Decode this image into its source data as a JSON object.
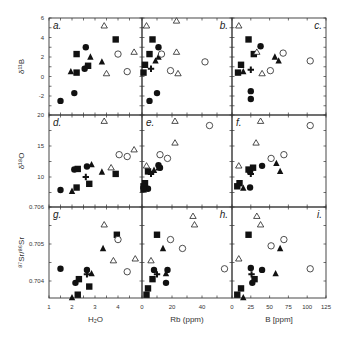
{
  "figure": {
    "panels": [
      "a.",
      "b.",
      "c.",
      "d.",
      "e.",
      "f.",
      "g.",
      "h.",
      "i."
    ],
    "x_axes": [
      {
        "label": "H₂O",
        "ticks": [
          "1",
          "2",
          "3",
          "4"
        ]
      },
      {
        "label": "Rb (ppm)",
        "ticks": [
          "0",
          "20",
          "40"
        ]
      },
      {
        "label": "B [ppm]",
        "ticks": [
          "0",
          "25",
          "50",
          "75",
          "100",
          "125"
        ]
      }
    ],
    "y_axes": [
      {
        "label": "δ¹¹B",
        "ticks": [
          "6",
          "4",
          "2",
          "0",
          "-2"
        ]
      },
      {
        "label": "δ¹⁸O",
        "ticks": [
          "20",
          "15",
          "10"
        ]
      },
      {
        "label": "⁸⁷Sr/⁸⁶Sr",
        "ticks": [
          "0.706",
          "0.705",
          "0.704"
        ]
      }
    ]
  },
  "chart_data": {
    "type": "scatter",
    "title": "",
    "layout": "3x3 scatter matrix with shared axes",
    "marker_legend": [
      "filled circle",
      "filled square",
      "filled triangle",
      "cross",
      "open circle",
      "open triangle"
    ],
    "x_variables": [
      {
        "name": "H2O",
        "xlabel": "H₂O",
        "xlim": [
          1,
          5
        ],
        "ticks": [
          1,
          2,
          3,
          4
        ]
      },
      {
        "name": "Rb",
        "xlabel": "Rb (ppm)",
        "xlim": [
          0,
          55
        ],
        "ticks": [
          0,
          20,
          40
        ]
      },
      {
        "name": "B",
        "xlabel": "B [ppm]",
        "xlim": [
          0,
          125
        ],
        "ticks": [
          0,
          25,
          50,
          75,
          100,
          125
        ]
      }
    ],
    "y_variables": [
      {
        "name": "d11B",
        "ylabel": "δ¹¹B",
        "ylim": [
          -3.3,
          6
        ],
        "ticks": [
          6,
          4,
          2,
          0,
          -2
        ]
      },
      {
        "name": "d18O",
        "ylabel": "δ¹⁸O",
        "ylim": [
          7,
          20
        ],
        "ticks": [
          20,
          15,
          10
        ]
      },
      {
        "name": "Sr",
        "ylabel": "⁸⁷Sr/⁸⁶Sr",
        "ylim": [
          0.7035,
          0.706
        ],
        "ticks": [
          0.706,
          0.705,
          0.704
        ]
      }
    ],
    "panels": [
      {
        "id": "a",
        "x": "H2O",
        "y": "d11B",
        "points": [
          {
            "m": "circle",
            "x": 1.5,
            "y": -2.5
          },
          {
            "m": "circle",
            "x": 2.1,
            "y": -1.7
          },
          {
            "m": "circle",
            "x": 2.6,
            "y": 3.0
          },
          {
            "m": "circle",
            "x": 2.55,
            "y": 0.8
          },
          {
            "m": "square",
            "x": 2.2,
            "y": 2.3
          },
          {
            "m": "square",
            "x": 2.2,
            "y": 0.4
          },
          {
            "m": "square",
            "x": 2.7,
            "y": 1.1
          },
          {
            "m": "square",
            "x": 3.9,
            "y": 3.8
          },
          {
            "m": "triangle",
            "x": 1.95,
            "y": 0.5
          },
          {
            "m": "triangle",
            "x": 2.8,
            "y": 2.0
          },
          {
            "m": "triangle",
            "x": 3.3,
            "y": 1.5
          },
          {
            "m": "cross",
            "x": 2.6,
            "y": 0.9
          },
          {
            "m": "ocircle",
            "x": 4.0,
            "y": 2.3
          },
          {
            "m": "ocircle",
            "x": 4.4,
            "y": 0.5
          },
          {
            "m": "otriangle",
            "x": 3.4,
            "y": 5.2
          },
          {
            "m": "otriangle",
            "x": 3.5,
            "y": 0.3
          },
          {
            "m": "otriangle",
            "x": 4.7,
            "y": 2.5
          }
        ]
      },
      {
        "id": "b",
        "x": "Rb",
        "y": "d11B",
        "points": [
          {
            "m": "circle",
            "x": 11,
            "y": 3.0
          },
          {
            "m": "circle",
            "x": 10,
            "y": -1.7
          },
          {
            "m": "circle",
            "x": 5,
            "y": -2.5
          },
          {
            "m": "square",
            "x": 7,
            "y": 3.8
          },
          {
            "m": "square",
            "x": 5,
            "y": 2.3
          },
          {
            "m": "square",
            "x": 2,
            "y": 1.2
          },
          {
            "m": "square",
            "x": 1,
            "y": 0.4
          },
          {
            "m": "triangle",
            "x": 9,
            "y": 1.6
          },
          {
            "m": "triangle",
            "x": 11,
            "y": 2.0
          },
          {
            "m": "cross",
            "x": 6,
            "y": 0.8
          },
          {
            "m": "ocircle",
            "x": 13,
            "y": 2.3
          },
          {
            "m": "ocircle",
            "x": 19,
            "y": 0.6
          },
          {
            "m": "ocircle",
            "x": 42,
            "y": 1.5
          },
          {
            "m": "otriangle",
            "x": 3,
            "y": 5.2
          },
          {
            "m": "otriangle",
            "x": 23,
            "y": 5.7
          },
          {
            "m": "otriangle",
            "x": 23,
            "y": 2.5
          },
          {
            "m": "otriangle",
            "x": 24,
            "y": 0.3
          }
        ]
      },
      {
        "id": "c",
        "x": "B",
        "y": "d11B",
        "points": [
          {
            "m": "circle",
            "x": 38,
            "y": 3.1
          },
          {
            "m": "circle",
            "x": 25,
            "y": -1.5
          },
          {
            "m": "circle",
            "x": 25,
            "y": -2.3
          },
          {
            "m": "square",
            "x": 22,
            "y": 3.8
          },
          {
            "m": "square",
            "x": 29,
            "y": 2.3
          },
          {
            "m": "square",
            "x": 12,
            "y": 1.2
          },
          {
            "m": "square",
            "x": 8,
            "y": 0.4
          },
          {
            "m": "triangle",
            "x": 15,
            "y": 0.5
          },
          {
            "m": "triangle",
            "x": 57,
            "y": 2.0
          },
          {
            "m": "triangle",
            "x": 62,
            "y": 1.6
          },
          {
            "m": "cross",
            "x": 25,
            "y": 0.7
          },
          {
            "m": "ocircle",
            "x": 68,
            "y": 2.4
          },
          {
            "m": "ocircle",
            "x": 51,
            "y": 0.6
          },
          {
            "m": "ocircle",
            "x": 104,
            "y": 1.6
          },
          {
            "m": "otriangle",
            "x": 9,
            "y": 5.2
          },
          {
            "m": "otriangle",
            "x": 33,
            "y": 2.5
          },
          {
            "m": "otriangle",
            "x": 40,
            "y": 0.3
          }
        ]
      },
      {
        "id": "d",
        "x": "H2O",
        "y": "d18O",
        "points": [
          {
            "m": "circle",
            "x": 1.5,
            "y": 7.9
          },
          {
            "m": "circle",
            "x": 2.1,
            "y": 11.2
          },
          {
            "m": "circle",
            "x": 2.65,
            "y": 11.7
          },
          {
            "m": "square",
            "x": 2.25,
            "y": 11.3
          },
          {
            "m": "square",
            "x": 2.2,
            "y": 8.3
          },
          {
            "m": "square",
            "x": 2.75,
            "y": 8.9
          },
          {
            "m": "square",
            "x": 3.9,
            "y": 10.5
          },
          {
            "m": "triangle",
            "x": 2.0,
            "y": 7.7
          },
          {
            "m": "triangle",
            "x": 2.85,
            "y": 12.0
          },
          {
            "m": "triangle",
            "x": 3.3,
            "y": 10.8
          },
          {
            "m": "cross",
            "x": 2.6,
            "y": 10.0
          },
          {
            "m": "ocircle",
            "x": 4.05,
            "y": 13.6
          },
          {
            "m": "ocircle",
            "x": 4.4,
            "y": 13.3
          },
          {
            "m": "otriangle",
            "x": 3.4,
            "y": 19.0
          },
          {
            "m": "otriangle",
            "x": 3.7,
            "y": 11.5
          },
          {
            "m": "otriangle",
            "x": 4.7,
            "y": 14.4
          }
        ]
      },
      {
        "id": "e",
        "x": "Rb",
        "y": "d18O",
        "points": [
          {
            "m": "circle",
            "x": 12,
            "y": 11.5
          },
          {
            "m": "circle",
            "x": 11,
            "y": 11.9
          },
          {
            "m": "circle",
            "x": 4,
            "y": 8.1
          },
          {
            "m": "square",
            "x": 2,
            "y": 9.0
          },
          {
            "m": "square",
            "x": 1,
            "y": 8.5
          },
          {
            "m": "square",
            "x": 1,
            "y": 8.0
          },
          {
            "m": "square",
            "x": 4,
            "y": 10.9
          },
          {
            "m": "triangle",
            "x": 8,
            "y": 11.1
          },
          {
            "m": "triangle",
            "x": 11,
            "y": 11.5
          },
          {
            "m": "cross",
            "x": 6,
            "y": 10.5
          },
          {
            "m": "ocircle",
            "x": 12,
            "y": 13.6
          },
          {
            "m": "ocircle",
            "x": 17,
            "y": 13.0
          },
          {
            "m": "ocircle",
            "x": 45,
            "y": 18.3
          },
          {
            "m": "otriangle",
            "x": 3,
            "y": 11.8
          },
          {
            "m": "otriangle",
            "x": 22,
            "y": 19.0
          },
          {
            "m": "otriangle",
            "x": 22,
            "y": 15.5
          }
        ]
      },
      {
        "id": "f",
        "x": "B",
        "y": "d18O",
        "points": [
          {
            "m": "circle",
            "x": 40,
            "y": 11.8
          },
          {
            "m": "circle",
            "x": 24,
            "y": 8.3
          },
          {
            "m": "circle",
            "x": 24,
            "y": 10.9
          },
          {
            "m": "square",
            "x": 10,
            "y": 9.0
          },
          {
            "m": "square",
            "x": 7,
            "y": 8.5
          },
          {
            "m": "square",
            "x": 28,
            "y": 11.5
          },
          {
            "m": "square",
            "x": 22,
            "y": 11.2
          },
          {
            "m": "triangle",
            "x": 15,
            "y": 8.2
          },
          {
            "m": "triangle",
            "x": 59,
            "y": 12.2
          },
          {
            "m": "triangle",
            "x": 64,
            "y": 10.9
          },
          {
            "m": "cross",
            "x": 25,
            "y": 10.5
          },
          {
            "m": "ocircle",
            "x": 52,
            "y": 13.0
          },
          {
            "m": "ocircle",
            "x": 69,
            "y": 13.6
          },
          {
            "m": "ocircle",
            "x": 104,
            "y": 18.3
          },
          {
            "m": "otriangle",
            "x": 9,
            "y": 11.8
          },
          {
            "m": "otriangle",
            "x": 32,
            "y": 15.5
          },
          {
            "m": "otriangle",
            "x": 38,
            "y": 19.0
          }
        ]
      },
      {
        "id": "g",
        "x": "H2O",
        "y": "Sr",
        "points": [
          {
            "m": "circle",
            "x": 1.5,
            "y": 0.70433
          },
          {
            "m": "circle",
            "x": 2.15,
            "y": 0.70395
          },
          {
            "m": "circle",
            "x": 2.65,
            "y": 0.7043
          },
          {
            "m": "square",
            "x": 2.3,
            "y": 0.70405
          },
          {
            "m": "square",
            "x": 2.25,
            "y": 0.70363
          },
          {
            "m": "square",
            "x": 2.75,
            "y": 0.70385
          },
          {
            "m": "square",
            "x": 3.95,
            "y": 0.70525
          },
          {
            "m": "triangle",
            "x": 2.0,
            "y": 0.70355
          },
          {
            "m": "triangle",
            "x": 2.85,
            "y": 0.7042
          },
          {
            "m": "triangle",
            "x": 3.35,
            "y": 0.70488
          },
          {
            "m": "cross",
            "x": 2.65,
            "y": 0.70418
          },
          {
            "m": "ocircle",
            "x": 4.0,
            "y": 0.70512
          },
          {
            "m": "ocircle",
            "x": 4.4,
            "y": 0.70425
          },
          {
            "m": "otriangle",
            "x": 3.4,
            "y": 0.70552
          },
          {
            "m": "otriangle",
            "x": 3.8,
            "y": 0.70455
          },
          {
            "m": "otriangle",
            "x": 4.75,
            "y": 0.7046
          }
        ]
      },
      {
        "id": "h",
        "x": "Rb",
        "y": "Sr",
        "points": [
          {
            "m": "circle",
            "x": 8,
            "y": 0.7043
          },
          {
            "m": "circle",
            "x": 17,
            "y": 0.7043
          },
          {
            "m": "circle",
            "x": 16,
            "y": 0.70395
          },
          {
            "m": "square",
            "x": 10,
            "y": 0.70525
          },
          {
            "m": "square",
            "x": 7,
            "y": 0.70405
          },
          {
            "m": "square",
            "x": 4,
            "y": 0.7038
          },
          {
            "m": "square",
            "x": 3,
            "y": 0.70363
          },
          {
            "m": "triangle",
            "x": 14,
            "y": 0.70488
          },
          {
            "m": "triangle",
            "x": 16,
            "y": 0.7042
          },
          {
            "m": "cross",
            "x": 10,
            "y": 0.70418
          },
          {
            "m": "ocircle",
            "x": 19,
            "y": 0.70512
          },
          {
            "m": "ocircle",
            "x": 27,
            "y": 0.70488
          },
          {
            "m": "ocircle",
            "x": 55,
            "y": 0.70433
          },
          {
            "m": "otriangle",
            "x": 6,
            "y": 0.70455
          },
          {
            "m": "otriangle",
            "x": 34,
            "y": 0.70575
          },
          {
            "m": "otriangle",
            "x": 35,
            "y": 0.70552
          }
        ]
      },
      {
        "id": "i",
        "x": "B",
        "y": "Sr",
        "points": [
          {
            "m": "circle",
            "x": 25,
            "y": 0.70435
          },
          {
            "m": "circle",
            "x": 40,
            "y": 0.7043
          },
          {
            "m": "circle",
            "x": 27,
            "y": 0.70395
          },
          {
            "m": "square",
            "x": 22,
            "y": 0.70525
          },
          {
            "m": "square",
            "x": 30,
            "y": 0.70405
          },
          {
            "m": "square",
            "x": 12,
            "y": 0.7038
          },
          {
            "m": "square",
            "x": 7,
            "y": 0.70363
          },
          {
            "m": "triangle",
            "x": 15,
            "y": 0.70355
          },
          {
            "m": "triangle",
            "x": 64,
            "y": 0.70488
          },
          {
            "m": "triangle",
            "x": 58,
            "y": 0.7042
          },
          {
            "m": "cross",
            "x": 26,
            "y": 0.70418
          },
          {
            "m": "ocircle",
            "x": 52,
            "y": 0.70495
          },
          {
            "m": "ocircle",
            "x": 69,
            "y": 0.70512
          },
          {
            "m": "ocircle",
            "x": 104,
            "y": 0.70433
          },
          {
            "m": "otriangle",
            "x": 9,
            "y": 0.7046
          },
          {
            "m": "otriangle",
            "x": 33,
            "y": 0.70575
          },
          {
            "m": "otriangle",
            "x": 38,
            "y": 0.70552
          }
        ]
      }
    ]
  }
}
